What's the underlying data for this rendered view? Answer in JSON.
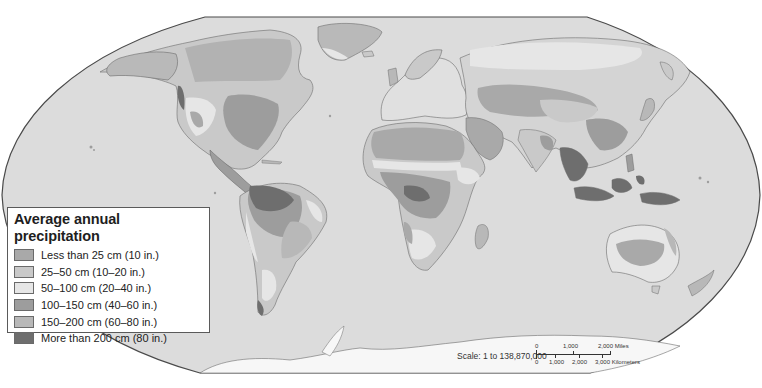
{
  "map": {
    "projection": "Robinson",
    "ocean_color": "#dcdcdc",
    "border_color": "#6b6b6b"
  },
  "legend": {
    "title": "Average annual precipitation",
    "items": [
      {
        "label": "Less than 25 cm (10 in.)",
        "color": "#a9a9a9"
      },
      {
        "label": "25–50 cm (10–20 in.)",
        "color": "#c9c9c9"
      },
      {
        "label": "50–100 cm (20–40 in.)",
        "color": "#e6e6e6"
      },
      {
        "label": "100–150 cm (40–60 in.)",
        "color": "#9d9d9d"
      },
      {
        "label": "150–200 cm (60–80 in.)",
        "color": "#b8b8b8"
      },
      {
        "label": "More than 200 cm (80 in.)",
        "color": "#6e6e6e"
      }
    ]
  },
  "scale": {
    "label": "Scale: 1 to 138,870,000",
    "miles_ticks": [
      "0",
      "1,000",
      "2,000 Miles"
    ],
    "km_ticks": [
      "0",
      "1,000",
      "2,000",
      "3,000 Kilometers"
    ]
  }
}
